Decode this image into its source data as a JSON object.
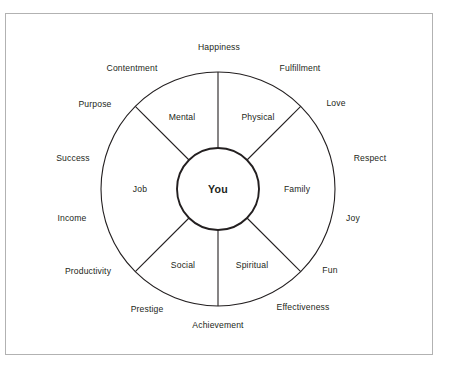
{
  "diagram": {
    "title_center": "You",
    "geometry": {
      "cx": 218,
      "cy": 189,
      "outer_radius": 117,
      "inner_radius": 41
    },
    "colors": {
      "stroke": "#231f20",
      "frame": "#b2b2b2",
      "background": "#ffffff",
      "text": "#231f20"
    },
    "sectors": [
      {
        "label": "Physical",
        "x": 258,
        "y": 117
      },
      {
        "label": "Mental",
        "x": 182,
        "y": 117
      },
      {
        "label": "Job",
        "x": 140,
        "y": 189
      },
      {
        "label": "Social",
        "x": 183,
        "y": 265
      },
      {
        "label": "Spiritual",
        "x": 252,
        "y": 265
      },
      {
        "label": "Family",
        "x": 297,
        "y": 189
      }
    ],
    "outer_labels": [
      {
        "label": "Happiness",
        "x": 219,
        "y": 47
      },
      {
        "label": "Fulfillment",
        "x": 300,
        "y": 68
      },
      {
        "label": "Love",
        "x": 336,
        "y": 103
      },
      {
        "label": "Respect",
        "x": 370,
        "y": 158
      },
      {
        "label": "Joy",
        "x": 353,
        "y": 218
      },
      {
        "label": "Fun",
        "x": 330,
        "y": 270
      },
      {
        "label": "Effectiveness",
        "x": 303,
        "y": 307
      },
      {
        "label": "Achievement",
        "x": 218,
        "y": 325
      },
      {
        "label": "Prestige",
        "x": 147,
        "y": 309
      },
      {
        "label": "Productivity",
        "x": 88,
        "y": 271
      },
      {
        "label": "Income",
        "x": 72,
        "y": 218
      },
      {
        "label": "Success",
        "x": 73,
        "y": 158
      },
      {
        "label": "Purpose",
        "x": 95,
        "y": 104
      },
      {
        "label": "Contentment",
        "x": 132,
        "y": 68
      }
    ]
  }
}
